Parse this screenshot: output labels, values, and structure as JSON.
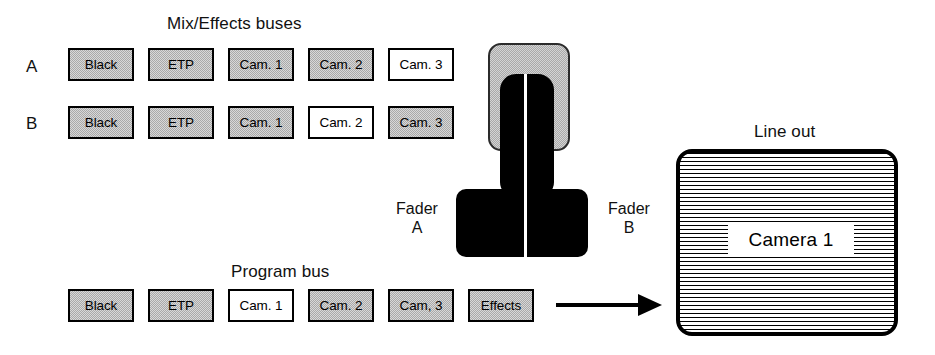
{
  "diagram": {
    "mix_effects": {
      "title": "Mix/Effects buses",
      "rows": [
        {
          "row_label": "A",
          "buttons": [
            {
              "label": "Black",
              "state": "gray"
            },
            {
              "label": "ETP",
              "state": "gray"
            },
            {
              "label": "Cam. 1",
              "state": "gray"
            },
            {
              "label": "Cam. 2",
              "state": "gray"
            },
            {
              "label": "Cam. 3",
              "state": "white"
            }
          ]
        },
        {
          "row_label": "B",
          "buttons": [
            {
              "label": "Black",
              "state": "gray"
            },
            {
              "label": "ETP",
              "state": "gray"
            },
            {
              "label": "Cam. 1",
              "state": "gray"
            },
            {
              "label": "Cam. 2",
              "state": "white"
            },
            {
              "label": "Cam. 3",
              "state": "gray"
            }
          ]
        }
      ]
    },
    "program_bus": {
      "title": "Program bus",
      "buttons": [
        {
          "label": "Black",
          "state": "gray"
        },
        {
          "label": "ETP",
          "state": "gray"
        },
        {
          "label": "Cam. 1",
          "state": "white"
        },
        {
          "label": "Cam. 2",
          "state": "gray"
        },
        {
          "label": "Cam, 3",
          "state": "gray"
        },
        {
          "label": "Effects",
          "state": "gray"
        }
      ]
    },
    "fader": {
      "left_label_line1": "Fader",
      "left_label_line2": "A",
      "right_label_line1": "Fader",
      "right_label_line2": "B"
    },
    "line_out": {
      "title": "Line out",
      "screen_caption": "Camera 1"
    },
    "colors": {
      "ink": "#000000",
      "button_gray": "#a9a9a9",
      "button_selected": "#ffffff",
      "page_background": "#ffffff"
    }
  }
}
